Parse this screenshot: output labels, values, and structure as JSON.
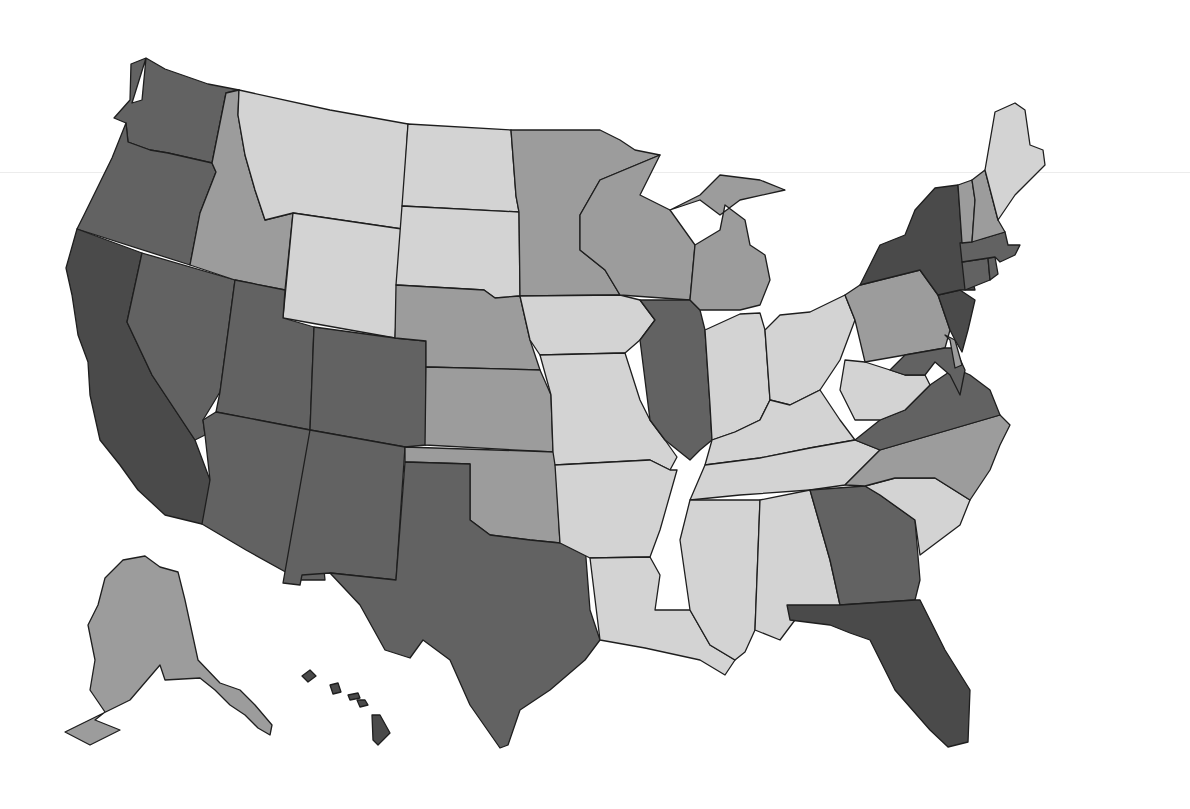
{
  "map": {
    "type": "choropleth",
    "region": "United States",
    "title": "",
    "legend": null,
    "shade_colors": {
      "darkest": "#4a4a4a",
      "dark": "#626262",
      "medium": "#9c9c9c",
      "light": "#d3d3d3"
    },
    "states": [
      {
        "code": "WA",
        "name": "Washington",
        "shade": "dark"
      },
      {
        "code": "OR",
        "name": "Oregon",
        "shade": "dark"
      },
      {
        "code": "CA",
        "name": "California",
        "shade": "darkest"
      },
      {
        "code": "NV",
        "name": "Nevada",
        "shade": "dark"
      },
      {
        "code": "ID",
        "name": "Idaho",
        "shade": "medium"
      },
      {
        "code": "MT",
        "name": "Montana",
        "shade": "light"
      },
      {
        "code": "WY",
        "name": "Wyoming",
        "shade": "light"
      },
      {
        "code": "UT",
        "name": "Utah",
        "shade": "dark"
      },
      {
        "code": "AZ",
        "name": "Arizona",
        "shade": "dark"
      },
      {
        "code": "CO",
        "name": "Colorado",
        "shade": "dark"
      },
      {
        "code": "NM",
        "name": "New Mexico",
        "shade": "dark"
      },
      {
        "code": "ND",
        "name": "North Dakota",
        "shade": "light"
      },
      {
        "code": "SD",
        "name": "South Dakota",
        "shade": "light"
      },
      {
        "code": "NE",
        "name": "Nebraska",
        "shade": "medium"
      },
      {
        "code": "KS",
        "name": "Kansas",
        "shade": "medium"
      },
      {
        "code": "OK",
        "name": "Oklahoma",
        "shade": "medium"
      },
      {
        "code": "TX",
        "name": "Texas",
        "shade": "dark"
      },
      {
        "code": "MN",
        "name": "Minnesota",
        "shade": "medium"
      },
      {
        "code": "IA",
        "name": "Iowa",
        "shade": "light"
      },
      {
        "code": "MO",
        "name": "Missouri",
        "shade": "light"
      },
      {
        "code": "AR",
        "name": "Arkansas",
        "shade": "light"
      },
      {
        "code": "LA",
        "name": "Louisiana",
        "shade": "light"
      },
      {
        "code": "WI",
        "name": "Wisconsin",
        "shade": "medium"
      },
      {
        "code": "IL",
        "name": "Illinois",
        "shade": "dark"
      },
      {
        "code": "MI",
        "name": "Michigan",
        "shade": "medium"
      },
      {
        "code": "IN",
        "name": "Indiana",
        "shade": "light"
      },
      {
        "code": "OH",
        "name": "Ohio",
        "shade": "light"
      },
      {
        "code": "KY",
        "name": "Kentucky",
        "shade": "light"
      },
      {
        "code": "TN",
        "name": "Tennessee",
        "shade": "light"
      },
      {
        "code": "MS",
        "name": "Mississippi",
        "shade": "light"
      },
      {
        "code": "AL",
        "name": "Alabama",
        "shade": "light"
      },
      {
        "code": "GA",
        "name": "Georgia",
        "shade": "dark"
      },
      {
        "code": "FL",
        "name": "Florida",
        "shade": "darkest"
      },
      {
        "code": "SC",
        "name": "South Carolina",
        "shade": "light"
      },
      {
        "code": "NC",
        "name": "North Carolina",
        "shade": "medium"
      },
      {
        "code": "VA",
        "name": "Virginia",
        "shade": "dark"
      },
      {
        "code": "WV",
        "name": "West Virginia",
        "shade": "light"
      },
      {
        "code": "PA",
        "name": "Pennsylvania",
        "shade": "medium"
      },
      {
        "code": "NY",
        "name": "New York",
        "shade": "darkest"
      },
      {
        "code": "NJ",
        "name": "New Jersey",
        "shade": "darkest"
      },
      {
        "code": "DE",
        "name": "Delaware",
        "shade": "medium"
      },
      {
        "code": "MD",
        "name": "Maryland",
        "shade": "dark"
      },
      {
        "code": "CT",
        "name": "Connecticut",
        "shade": "dark"
      },
      {
        "code": "RI",
        "name": "Rhode Island",
        "shade": "dark"
      },
      {
        "code": "MA",
        "name": "Massachusetts",
        "shade": "dark"
      },
      {
        "code": "VT",
        "name": "Vermont",
        "shade": "medium"
      },
      {
        "code": "NH",
        "name": "New Hampshire",
        "shade": "medium"
      },
      {
        "code": "ME",
        "name": "Maine",
        "shade": "light"
      },
      {
        "code": "AK",
        "name": "Alaska",
        "shade": "medium"
      },
      {
        "code": "HI",
        "name": "Hawaii",
        "shade": "darkest"
      }
    ]
  }
}
